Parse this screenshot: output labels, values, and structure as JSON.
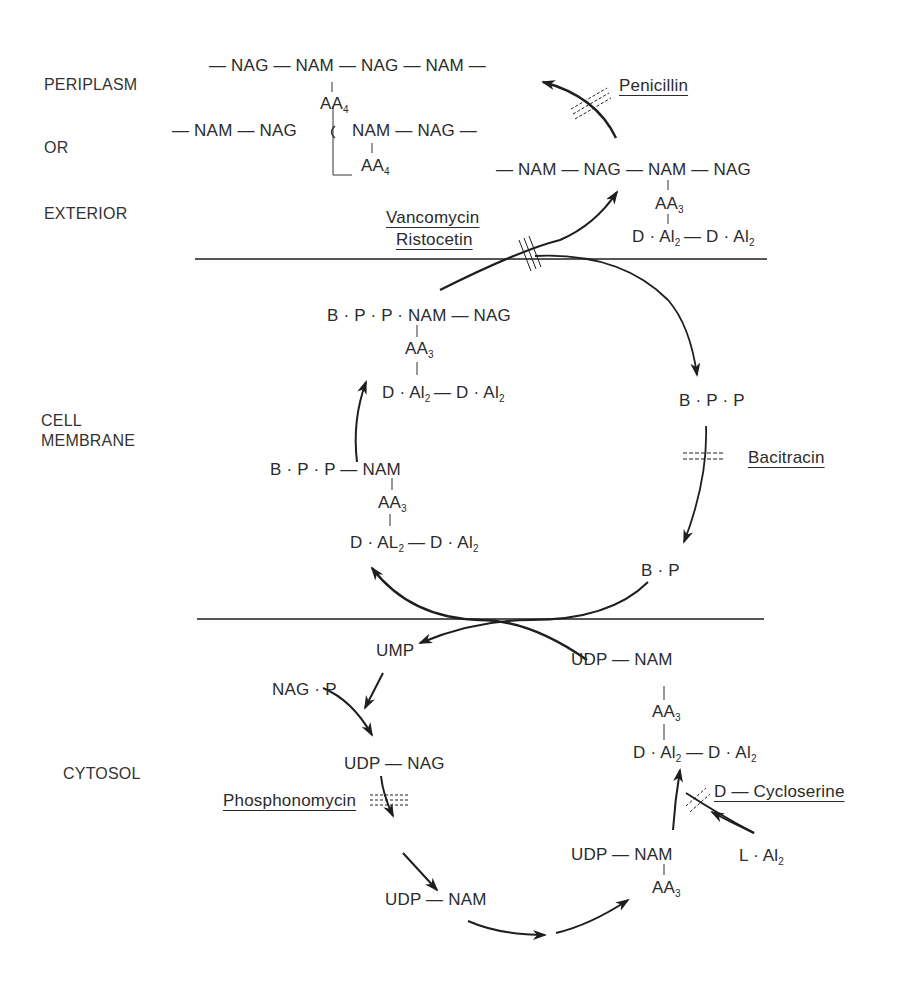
{
  "regions": {
    "periplasm": "PERIPLASM",
    "or": "OR",
    "exterior": "EXTERIOR",
    "cell": "CELL",
    "membrane": "MEMBRANE",
    "cytosol": "CYTOSOL"
  },
  "periplasm": {
    "chain1": "— NAG — NAM — NAG — NAM —",
    "chain1_aa": "AA",
    "chain1_aa_sub": "4",
    "chain2_left": "— NAM — NAG",
    "chain2_right": "NAM — NAG —",
    "chain2_aa": "AA",
    "chain2_aa_sub": "4",
    "chain3": "— NAM — NAG — NAM — NAG",
    "chain3_aa": "AA",
    "chain3_aa_sub": "3",
    "chain3_dal": "D · Al",
    "chain3_dal_sub": "2",
    "chain3_dal2": "— D · Al",
    "chain3_dal2_sub": "2"
  },
  "membrane": {
    "top_left": "B · P · P · NAM — NAG",
    "top_left_aa": "AA",
    "top_left_aa_sub": "3",
    "top_left_dal": "D · Al",
    "top_left_dal_sub": "2",
    "top_left_dal2": "— D · Al",
    "top_left_dal2_sub": "2",
    "bottom_left": "B · P · P — NAM",
    "bottom_left_aa": "AA",
    "bottom_left_aa_sub": "3",
    "bottom_left_dal": "D · AL",
    "bottom_left_dal_sub": "2",
    "bottom_left_dal2": "— D · Al",
    "bottom_left_dal2_sub": "2",
    "bpp": "B · P · P",
    "bp": "B · P"
  },
  "cytosol": {
    "ump": "UMP",
    "nag_p": "NAG · P",
    "udp_nag": "UDP — NAG",
    "udp_nam": "UDP — NAM",
    "udp_nam_aa_right": "UDP — NAM",
    "udp_nam_aa_right_aa": "AA",
    "udp_nam_aa_right_aa_sub": "3",
    "udp_nam_top": "UDP — NAM",
    "udp_nam_top_aa": "AA",
    "udp_nam_top_aa_sub": "3",
    "udp_nam_top_dal": "D · Al",
    "udp_nam_top_dal_sub": "2",
    "udp_nam_top_dal2": "— D · Al",
    "udp_nam_top_dal2_sub": "2",
    "l_al": "L · Al",
    "l_al_sub": "2"
  },
  "inhibitors": {
    "penicillin": "Penicillin",
    "vancomycin": "Vancomycin",
    "ristocetin": "Ristocetin",
    "bacitracin": "Bacitracin",
    "phosphonomycin": "Phosphonomycin",
    "cycloserine": "D — Cycloserine"
  },
  "colors": {
    "ink": "#1e1e1e",
    "text": "#2b2b2b",
    "background": "#ffffff"
  }
}
